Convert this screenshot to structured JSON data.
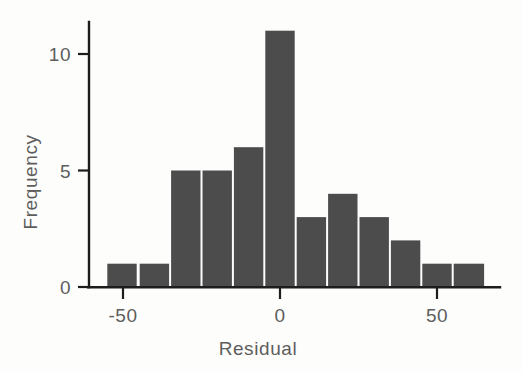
{
  "chart_data": {
    "type": "bar",
    "title": "",
    "subtitle": "",
    "xlabel": "Residual",
    "ylabel": "Frequency",
    "xlim": [
      -58,
      70
    ],
    "ylim": [
      0,
      11.8
    ],
    "grid": false,
    "legend": null,
    "bin_width": 10,
    "bin_edges": [
      -55,
      -45,
      -35,
      -25,
      -15,
      -5,
      5,
      15,
      25,
      35,
      45,
      55,
      65
    ],
    "bin_centers": [
      -50,
      -40,
      -30,
      -20,
      -10,
      0,
      10,
      20,
      30,
      40,
      50,
      60
    ],
    "categories": [
      "-55 to -45",
      "-45 to -35",
      "-35 to -25",
      "-25 to -15",
      "-15 to -5",
      "-5 to 5",
      "5 to 15",
      "15 to 25",
      "25 to 35",
      "35 to 45",
      "45 to 55",
      "55 to 65"
    ],
    "values": [
      1,
      1,
      5,
      5,
      6,
      11,
      3,
      4,
      3,
      2,
      1,
      1
    ],
    "x_ticks": [
      -50,
      0,
      50
    ],
    "x_tick_labels": [
      "-50",
      "0",
      "50"
    ],
    "y_ticks": [
      0,
      5,
      10
    ],
    "y_tick_labels": [
      "0",
      "5",
      "10"
    ],
    "bar_color": "#4c4c4c",
    "axis_color": "#1d1d1d",
    "text_color": "#5d5d5d",
    "background_color": "#fdfdfc",
    "total_count": 43
  },
  "axes": {
    "x_title": "Residual",
    "y_title": "Frequency"
  },
  "x_tick_items": [
    {
      "label": "-50",
      "value": -50
    },
    {
      "label": "0",
      "value": 0
    },
    {
      "label": "50",
      "value": 50
    }
  ],
  "y_tick_items": [
    {
      "label": "0",
      "value": 0
    },
    {
      "label": "5",
      "value": 5
    },
    {
      "label": "10",
      "value": 10
    }
  ],
  "bars": [
    {
      "label": "-55 to -45",
      "value": 1
    },
    {
      "label": "-45 to -35",
      "value": 1
    },
    {
      "label": "-35 to -25",
      "value": 5
    },
    {
      "label": "-25 to -15",
      "value": 5
    },
    {
      "label": "-15 to -5",
      "value": 6
    },
    {
      "label": "-5 to 5",
      "value": 11
    },
    {
      "label": "5 to 15",
      "value": 3
    },
    {
      "label": "15 to 25",
      "value": 4
    },
    {
      "label": "25 to 35",
      "value": 3
    },
    {
      "label": "35 to 45",
      "value": 2
    },
    {
      "label": "45 to 55",
      "value": 1
    },
    {
      "label": "55 to 65",
      "value": 1
    }
  ]
}
